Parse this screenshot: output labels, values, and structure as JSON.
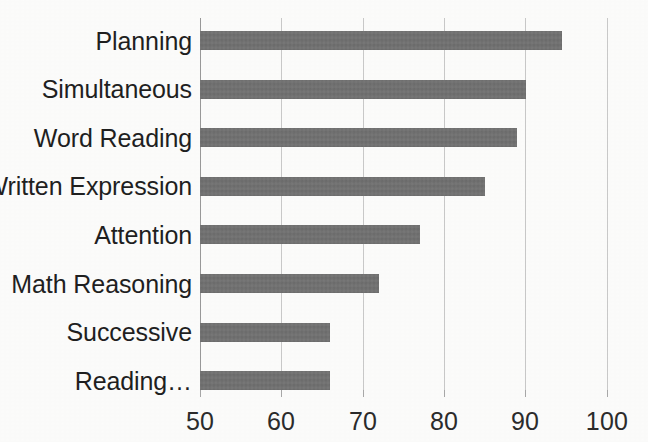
{
  "chart_data": {
    "type": "bar",
    "orientation": "horizontal",
    "title": "",
    "subtitle": "",
    "xlabel": "",
    "ylabel": "",
    "categories": [
      "Planning",
      "Simultaneous",
      "Word Reading",
      "Written Expression",
      "Attention",
      "Math Reasoning",
      "Successive",
      "Reading…"
    ],
    "values": [
      94.5,
      90,
      89,
      85,
      77,
      72,
      66,
      66
    ],
    "series": [
      {
        "name": "",
        "values": [
          94.5,
          90,
          89,
          85,
          77,
          72,
          66,
          66
        ]
      }
    ],
    "xlim": [
      50,
      100
    ],
    "xticks": [
      50,
      60,
      70,
      80,
      90,
      100
    ],
    "xtick_labels": [
      "50",
      "60",
      "70",
      "80",
      "90",
      "100"
    ],
    "grid": true,
    "grid_axis": "x",
    "legend": false,
    "legend_position": "none",
    "annotations": [],
    "colors": {
      "bar": "#6e6e6e",
      "gridline": "#c9c9c9",
      "axis": "#9a9a9a",
      "text": "#1f1f1f",
      "background": "#fcfcfb"
    }
  }
}
